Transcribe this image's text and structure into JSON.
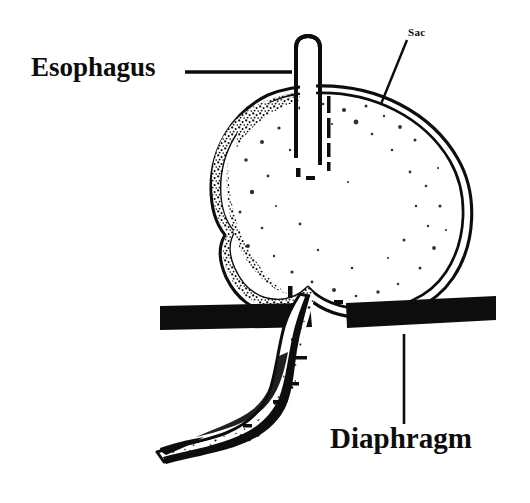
{
  "figure": {
    "style": "black-and-white line drawing with stippled shading",
    "background_color": "#ffffff",
    "ink_color": "#0d0d0d"
  },
  "labels": {
    "esophagus": {
      "text": "Esophagus",
      "leader": "horizontal-line-right"
    },
    "sac": {
      "text": "Sac",
      "leader": "diagonal-line-down-left"
    },
    "diaphragm": {
      "text": "Diaphragm",
      "leader": "vertical-line-up"
    }
  },
  "structures": {
    "esophagus_tube": "vertical tube entering sac from above",
    "hernia_sac": "large rounded sac above the diaphragm",
    "diaphragm_left_bar": "thick black horizontal bar, left side",
    "diaphragm_right_bar": "thick black horizontal bar, right side",
    "distal_esophagus": "curving tube descending below the diaphragm"
  }
}
